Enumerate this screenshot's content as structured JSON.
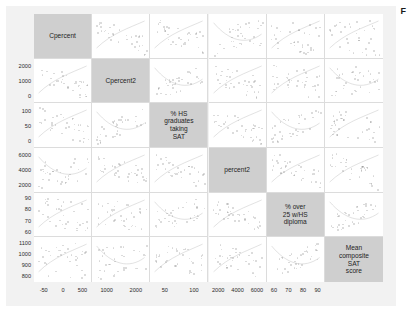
{
  "caption": "F",
  "chart_data": {
    "type": "scatter",
    "title": "",
    "subtitle": "",
    "xlabel": "",
    "ylabel": "",
    "grid": true,
    "legend": null,
    "matrix": {
      "rows": 6,
      "cols": 6,
      "note": "scatterplot matrix (SPLOM); diagonal cells hold variable name labels"
    },
    "variables": [
      {
        "index": 0,
        "label": "Cpercent",
        "x_ticks": [
          "-50",
          "0",
          "500"
        ],
        "y_ticks": [],
        "range": [
          -80,
          700
        ]
      },
      {
        "index": 1,
        "label": "Cpercent2",
        "x_ticks": [
          "1000",
          "2000"
        ],
        "y_ticks": [
          "2000",
          "1000",
          "0"
        ],
        "range": [
          0,
          2600
        ]
      },
      {
        "index": 2,
        "label": "% HS\ngraduates\ntaking\nSAT",
        "x_ticks": [
          "50",
          "100"
        ],
        "y_ticks": [
          "100",
          "50",
          "0"
        ],
        "range": [
          0,
          120
        ]
      },
      {
        "index": 3,
        "label": "percent2",
        "x_ticks": [
          "2000",
          "4000",
          "6000"
        ],
        "y_ticks": [
          "6000",
          "4000",
          "2000"
        ],
        "range": [
          0,
          7000
        ]
      },
      {
        "index": 4,
        "label": "% over\n25 w/HS\ndiploma",
        "x_ticks": [
          "60",
          "70",
          "80",
          "90"
        ],
        "y_ticks": [
          "90",
          "80",
          "70",
          "60"
        ],
        "range": [
          58,
          95
        ]
      },
      {
        "index": 5,
        "label": "Mean\ncomposite\nSAT\nscore",
        "x_ticks": [],
        "y_ticks": [
          "1100",
          "1000",
          "900",
          "800"
        ],
        "range": [
          780,
          1120
        ]
      }
    ],
    "y_tick_labels_all": [
      "2000",
      "1000",
      "0",
      "100",
      "50",
      "0",
      "6000",
      "4000",
      "2000",
      "90",
      "80",
      "70",
      "60",
      "1100",
      "1000",
      "900",
      "800"
    ],
    "x_tick_labels_all": [
      "-50",
      "0",
      "500",
      "1000",
      "2000",
      "50",
      "100",
      "2000",
      "4000",
      "6000",
      "60",
      "70",
      "80",
      "90"
    ]
  },
  "colors": {
    "page_background": "#ffffff",
    "card_background": "#f2f2f2",
    "panel_background": "#ffffff",
    "diagonal_background": "#cfcfcf",
    "gridline": "#dcdcdc",
    "tick_text": "#2b2b2b",
    "label_text": "#242424",
    "point": "rgba(120,120,120,0.30)"
  }
}
